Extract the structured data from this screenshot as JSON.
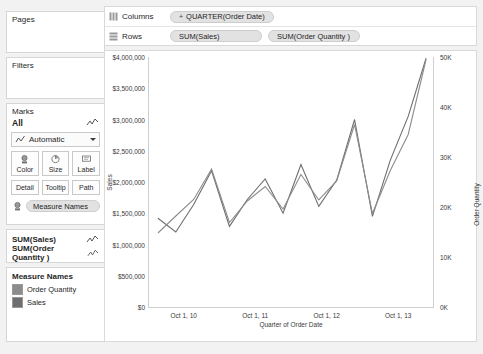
{
  "sidebar": {
    "pages": {
      "title": "Pages"
    },
    "filters": {
      "title": "Filters"
    },
    "marks": {
      "title": "Marks",
      "all_label": "All",
      "mark_type": "Automatic",
      "buttons_row1": [
        "Color",
        "Size",
        "Label"
      ],
      "buttons_row2": [
        "Detail",
        "Tooltip",
        "Path"
      ],
      "pill_label": "Measure Names"
    },
    "measures": [
      {
        "label": "SUM(Sales)"
      },
      {
        "label": "SUM(Order Quantity )"
      }
    ],
    "legend": {
      "title": "Measure Names",
      "items": [
        {
          "label": "Order Quantity",
          "color": "#8c8c8c"
        },
        {
          "label": "Sales",
          "color": "#6e6e6e"
        }
      ]
    }
  },
  "shelves": {
    "columns": {
      "name": "Columns",
      "pill": "QUARTER(Order Date)",
      "expand": "+"
    },
    "rows": {
      "name": "Rows",
      "pill1": "SUM(Sales)",
      "pill2": "SUM(Order Quantity )"
    }
  },
  "chart_data": {
    "type": "line",
    "title": "",
    "xlabel": "Quarter of Order Date",
    "ylabel": "Sales",
    "ylabel_right": "Order Quantity",
    "grid": false,
    "legend_position": "left-sidebar",
    "x_ticks": [
      "Oct 1, 10",
      "Oct 1, 11",
      "Oct 1, 12",
      "Oct 1, 13"
    ],
    "y_ticks_left": [
      "$0",
      "$500,000",
      "$1,000,000",
      "$1,500,000",
      "$2,000,000",
      "$2,500,000",
      "$3,000,000",
      "$3,500,000",
      "$4,000,000"
    ],
    "y_ticks_right": [
      "0K",
      "10K",
      "20K",
      "30K",
      "40K",
      "50K"
    ],
    "ylim_left": [
      0,
      4000000
    ],
    "ylim_right": [
      0,
      50000
    ],
    "x": [
      "2010 Q1",
      "2010 Q2",
      "2010 Q3",
      "2010 Q4",
      "2011 Q1",
      "2011 Q2",
      "2011 Q3",
      "2011 Q4",
      "2012 Q1",
      "2012 Q2",
      "2012 Q3",
      "2012 Q4",
      "2013 Q1",
      "2013 Q2",
      "2013 Q3",
      "2013 Q4"
    ],
    "series": [
      {
        "name": "Sales",
        "color": "#6e6e6e",
        "axis": "left",
        "values": [
          1420000,
          1200000,
          1640000,
          2180000,
          1290000,
          1720000,
          2050000,
          1500000,
          2280000,
          1610000,
          2030000,
          3000000,
          1450000,
          2350000,
          3050000,
          3980000
        ]
      },
      {
        "name": "Order Quantity",
        "color": "#8c8c8c",
        "axis": "right",
        "values": [
          14800,
          18200,
          21500,
          27600,
          16900,
          21200,
          24100,
          19600,
          26500,
          21400,
          25200,
          36500,
          18700,
          27300,
          34500,
          49500
        ]
      }
    ]
  }
}
